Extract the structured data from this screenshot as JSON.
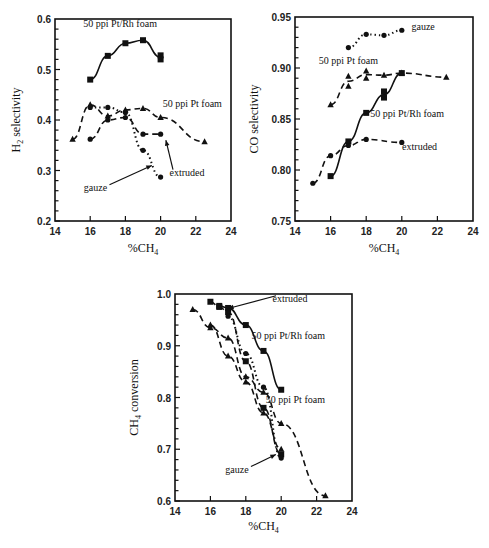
{
  "chart_data": [
    {
      "type": "line",
      "title": "",
      "xlabel": "%CH4",
      "ylabel": "H2 selectivity",
      "xlim": [
        14,
        24
      ],
      "ylim": [
        0.2,
        0.6
      ],
      "xticks": [
        14,
        16,
        18,
        20,
        22,
        24
      ],
      "yticks": [
        0.2,
        0.3,
        0.4,
        0.5,
        0.6
      ],
      "ytick_labels": [
        "0.2",
        "0.3",
        "0.4",
        "0.5",
        "0.6"
      ],
      "grid": false,
      "legend": "inline annotations",
      "series": [
        {
          "name": "50 ppi Pt/Rh foam",
          "style": "solid",
          "marker": "square",
          "x": [
            16,
            17,
            18,
            19,
            20,
            20
          ],
          "y": [
            0.48,
            0.527,
            0.552,
            0.558,
            0.528,
            0.52
          ]
        },
        {
          "name": "50 ppi Pt foam",
          "style": "dashed",
          "marker": "triangle",
          "x": [
            15,
            16,
            17,
            18,
            19,
            20,
            22.5
          ],
          "y": [
            0.362,
            0.43,
            0.408,
            0.42,
            0.423,
            0.405,
            0.357
          ]
        },
        {
          "name": "extruded",
          "style": "dashed",
          "marker": "circle",
          "x": [
            16,
            17,
            18,
            19,
            20
          ],
          "y": [
            0.362,
            0.4,
            0.405,
            0.372,
            0.372
          ]
        },
        {
          "name": "gauze",
          "style": "dotted",
          "marker": "circle",
          "x": [
            16,
            17,
            18,
            19,
            20
          ],
          "y": [
            0.425,
            0.425,
            0.415,
            0.34,
            0.287
          ]
        }
      ],
      "annotations": [
        {
          "text": "50 ppi Pt/Rh foam",
          "x": 17.7,
          "y": 0.585
        },
        {
          "text": "50 ppi Pt foam",
          "x": 21.8,
          "y": 0.425
        },
        {
          "text": "extruded",
          "x": 21.5,
          "y": 0.29,
          "arrow_to": [
            20.3,
            0.36
          ]
        },
        {
          "text": "gauze",
          "x": 16.3,
          "y": 0.26,
          "arrow_to": [
            19.5,
            0.31
          ]
        }
      ]
    },
    {
      "type": "line",
      "title": "",
      "xlabel": "%CH4",
      "ylabel": "CO selectivity",
      "xlim": [
        14,
        24
      ],
      "ylim": [
        0.75,
        0.95
      ],
      "xticks": [
        14,
        16,
        18,
        20,
        22,
        24
      ],
      "yticks": [
        0.75,
        0.8,
        0.85,
        0.9,
        0.95
      ],
      "ytick_labels": [
        "0.75",
        "0.80",
        "0.85",
        "0.90",
        "0.95"
      ],
      "grid": false,
      "legend": "inline annotations",
      "series": [
        {
          "name": "gauze",
          "style": "dashdot",
          "marker": "circle",
          "x": [
            17,
            18,
            19,
            20
          ],
          "y": [
            0.92,
            0.933,
            0.932,
            0.937
          ]
        },
        {
          "name": "50 ppi Pt foam",
          "style": "dashed",
          "marker": "triangle",
          "x": [
            16,
            17,
            17,
            18,
            18,
            19,
            20,
            22.5
          ],
          "y": [
            0.864,
            0.892,
            0.882,
            0.897,
            0.89,
            0.893,
            0.895,
            0.891
          ]
        },
        {
          "name": "50 ppi Pt/Rh foam",
          "style": "solid",
          "marker": "square",
          "x": [
            16,
            17,
            18,
            19,
            19,
            20
          ],
          "y": [
            0.794,
            0.828,
            0.856,
            0.871,
            0.877,
            0.895
          ]
        },
        {
          "name": "extruded",
          "style": "dashed",
          "marker": "circle",
          "x": [
            15,
            16,
            17,
            18,
            20
          ],
          "y": [
            0.787,
            0.814,
            0.824,
            0.83,
            0.827
          ]
        }
      ],
      "annotations": [
        {
          "text": "gauze",
          "x": 21.2,
          "y": 0.937
        },
        {
          "text": "50 ppi Pt foam",
          "x": 17.0,
          "y": 0.904
        },
        {
          "text": "50 ppi Pt/Rh foam",
          "x": 20.3,
          "y": 0.852
        },
        {
          "text": "extruded",
          "x": 21.0,
          "y": 0.82
        }
      ]
    },
    {
      "type": "line",
      "title": "",
      "xlabel": "%CH4",
      "ylabel": "CH4 conversion",
      "xlim": [
        14,
        24
      ],
      "ylim": [
        0.6,
        1.0
      ],
      "xticks": [
        14,
        16,
        18,
        20,
        22,
        24
      ],
      "yticks": [
        0.6,
        0.7,
        0.8,
        0.9,
        1.0
      ],
      "ytick_labels": [
        "0.6",
        "0.7",
        "0.8",
        "0.9",
        "1.0"
      ],
      "grid": false,
      "legend": "inline annotations",
      "series": [
        {
          "name": "extruded",
          "style": "dashed",
          "marker": "square",
          "x": [
            16,
            16.5,
            17,
            18,
            19,
            20
          ],
          "y": [
            0.985,
            0.975,
            0.965,
            0.87,
            0.78,
            0.69
          ]
        },
        {
          "name": "50 ppi Pt/Rh foam",
          "style": "solid",
          "marker": "square",
          "x": [
            16.5,
            17,
            18,
            19,
            20
          ],
          "y": [
            0.977,
            0.973,
            0.94,
            0.89,
            0.815
          ]
        },
        {
          "name": "50 ppi Pt foam",
          "style": "dashed",
          "marker": "triangle",
          "x": [
            15,
            16,
            17,
            18,
            19,
            20,
            22.5
          ],
          "y": [
            0.97,
            0.935,
            0.915,
            0.84,
            0.81,
            0.75,
            0.61
          ]
        },
        {
          "name": "gauze",
          "style": "dotted",
          "marker": "circle",
          "x": [
            17,
            18,
            19,
            20
          ],
          "y": [
            0.957,
            0.885,
            0.82,
            0.683
          ]
        },
        {
          "name": "Pt foam (second run)",
          "style": "dashed",
          "marker": "triangle",
          "x": [
            16,
            17,
            18,
            19,
            20
          ],
          "y": [
            0.94,
            0.88,
            0.83,
            0.77,
            0.7
          ]
        }
      ],
      "annotations": [
        {
          "text": "extruded",
          "x": 20.5,
          "y": 0.985,
          "arrow_to": [
            17.0,
            0.972
          ]
        },
        {
          "text": "50 ppi Pt/Rh foam",
          "x": 20.4,
          "y": 0.913
        },
        {
          "text": "50 ppi Pt foam",
          "x": 20.8,
          "y": 0.79
        },
        {
          "text": "gauze",
          "x": 17.5,
          "y": 0.655,
          "arrow_to": [
            19.7,
            0.69
          ]
        }
      ]
    }
  ]
}
